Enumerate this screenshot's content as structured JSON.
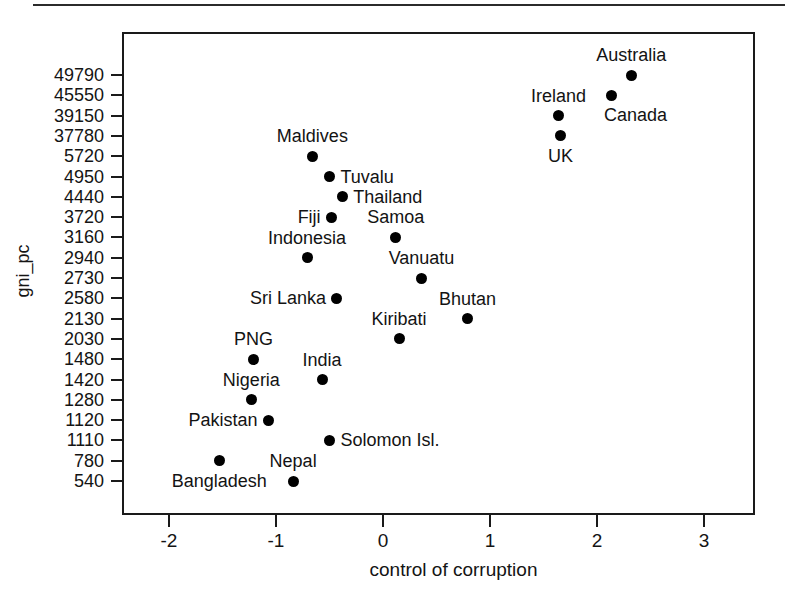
{
  "chart_data": {
    "type": "scatter",
    "title": "",
    "xlabel": "control of corruption",
    "ylabel": "gni_pc",
    "xlim": [
      -2.42,
      3.0
    ],
    "x_ticks": [
      "-2",
      "-1",
      "0",
      "1",
      "2",
      "3"
    ],
    "x_tick_values": [
      -2,
      -1,
      0,
      1,
      2,
      3
    ],
    "y_ticks": [
      "49790",
      "45550",
      "39150",
      "37780",
      "5720",
      "4950",
      "4440",
      "3720",
      "3160",
      "2940",
      "2730",
      "2580",
      "2130",
      "2030",
      "1480",
      "1420",
      "1280",
      "1120",
      "1110",
      "780",
      "540"
    ],
    "y_axis_type": "categorical-ordered",
    "grid": false,
    "legend": false,
    "points": [
      {
        "label": "Australia",
        "x": 2.32,
        "y": 49790,
        "label_pos": "above-center"
      },
      {
        "label": "Canada",
        "x": 2.14,
        "y": 45550,
        "label_pos": "below-right"
      },
      {
        "label": "Ireland",
        "x": 1.64,
        "y": 39150,
        "label_pos": "above-center"
      },
      {
        "label": "UK",
        "x": 1.66,
        "y": 37780,
        "label_pos": "below-center"
      },
      {
        "label": "Maldives",
        "x": -0.66,
        "y": 5720,
        "label_pos": "above-center"
      },
      {
        "label": "Tuvalu",
        "x": -0.5,
        "y": 4950,
        "label_pos": "right"
      },
      {
        "label": "Thailand",
        "x": -0.38,
        "y": 4440,
        "label_pos": "right"
      },
      {
        "label": "Fiji",
        "x": -0.48,
        "y": 3720,
        "label_pos": "left"
      },
      {
        "label": "Samoa",
        "x": 0.12,
        "y": 3160,
        "label_pos": "above-center"
      },
      {
        "label": "Indonesia",
        "x": -0.71,
        "y": 2940,
        "label_pos": "above-center"
      },
      {
        "label": "Vanuatu",
        "x": 0.36,
        "y": 2730,
        "label_pos": "above-center"
      },
      {
        "label": "Sri Lanka",
        "x": -0.43,
        "y": 2580,
        "label_pos": "left"
      },
      {
        "label": "Bhutan",
        "x": 0.79,
        "y": 2130,
        "label_pos": "above-center"
      },
      {
        "label": "Kiribati",
        "x": 0.15,
        "y": 2030,
        "label_pos": "above-center"
      },
      {
        "label": "PNG",
        "x": -1.21,
        "y": 1480,
        "label_pos": "above-center"
      },
      {
        "label": "India",
        "x": -0.57,
        "y": 1420,
        "label_pos": "above-center"
      },
      {
        "label": "Nigeria",
        "x": -1.23,
        "y": 1280,
        "label_pos": "above-center"
      },
      {
        "label": "Pakistan",
        "x": -1.07,
        "y": 1120,
        "label_pos": "left"
      },
      {
        "label": "Solomon Isl.",
        "x": -0.5,
        "y": 1110,
        "label_pos": "right"
      },
      {
        "label": "Bangladesh",
        "x": -1.53,
        "y": 780,
        "label_pos": "below-center"
      },
      {
        "label": "Nepal",
        "x": -0.84,
        "y": 540,
        "label_pos": "above-center"
      }
    ]
  }
}
